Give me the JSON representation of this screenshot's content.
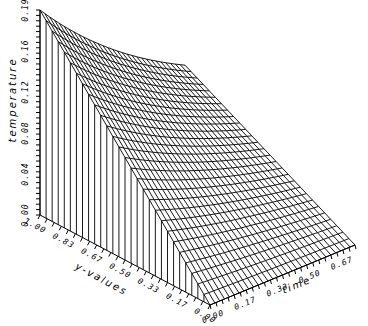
{
  "chart_data": {
    "type": "surface3d",
    "title": "",
    "zlabel": "temperature",
    "ylabel": "y-values",
    "xlabel": "time",
    "z_ticks": [
      "0.00",
      "0.04",
      "0.08",
      "0.12",
      "0.16",
      "0.19"
    ],
    "y_ticks": [
      "1.00",
      "0.83",
      "0.67",
      "0.50",
      "0.33",
      "0.17",
      "0.00"
    ],
    "x_ticks": [
      "0.00",
      "0.17",
      "0.33",
      "0.50",
      "0.67"
    ],
    "zlim": [
      0,
      0.19
    ],
    "ylim": [
      0,
      1
    ],
    "xlim": [
      0,
      0.75
    ],
    "grid": false
  },
  "labels": {
    "z_axis": "temperature",
    "y_axis": "y-values",
    "x_axis": "time"
  }
}
